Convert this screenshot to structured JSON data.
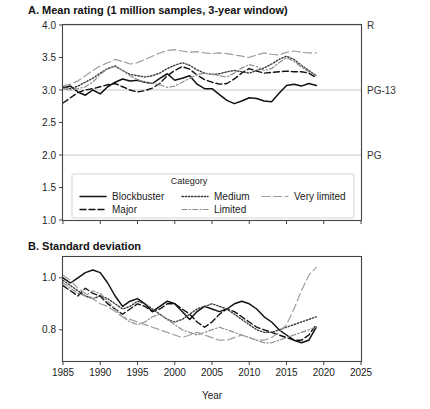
{
  "figure": {
    "axis_title": "Year",
    "legend_title": "Category"
  },
  "chart_data": [
    {
      "id": "panel_a",
      "type": "line",
      "title": "A. Mean rating (1 million samples, 3-year window)",
      "xlabel": "",
      "ylabel": "",
      "xlim": [
        1985,
        2025
      ],
      "ylim": [
        1.0,
        4.0
      ],
      "xticks": [
        1985,
        1990,
        1995,
        2000,
        2005,
        2010,
        2015,
        2020,
        2025
      ],
      "xticklabels": [
        "",
        "",
        "",
        "",
        "",
        "",
        "",
        "",
        ""
      ],
      "yticks": [
        1.0,
        1.5,
        2.0,
        2.5,
        3.0,
        3.5,
        4.0
      ],
      "yticklabels": [
        "1.0",
        "1.5",
        "2.0",
        "2.5",
        "3.0",
        "3.5",
        "4.0"
      ],
      "grid": true,
      "gridlines_y": [
        2.0,
        3.0,
        4.0
      ],
      "reference_labels": [
        {
          "text": "R",
          "value": 4.0
        },
        {
          "text": "PG-13",
          "value": 3.0
        },
        {
          "text": "PG",
          "value": 2.0
        }
      ],
      "legend_position": "inside-bottom",
      "x": [
        1985,
        1986,
        1987,
        1988,
        1989,
        1990,
        1991,
        1992,
        1993,
        1994,
        1995,
        1996,
        1997,
        1998,
        1999,
        2000,
        2001,
        2002,
        2003,
        2004,
        2005,
        2006,
        2007,
        2008,
        2009,
        2010,
        2011,
        2012,
        2013,
        2014,
        2015,
        2016,
        2017,
        2018,
        2019
      ],
      "series": [
        {
          "name": "Blockbuster",
          "style": "solid",
          "color": "#111111",
          "values": [
            3.03,
            3.06,
            2.97,
            2.92,
            3.0,
            2.94,
            3.05,
            3.12,
            3.17,
            3.14,
            3.15,
            3.12,
            3.1,
            3.18,
            3.25,
            3.15,
            3.18,
            3.22,
            3.09,
            3.02,
            3.02,
            2.93,
            2.84,
            2.79,
            2.83,
            2.88,
            2.87,
            2.83,
            2.82,
            2.95,
            3.07,
            3.09,
            3.06,
            3.1,
            3.07
          ]
        },
        {
          "name": "Major",
          "style": "dashed",
          "color": "#111111",
          "values": [
            2.8,
            2.88,
            2.96,
            3.0,
            3.02,
            3.05,
            3.08,
            3.1,
            3.05,
            3.0,
            2.97,
            2.99,
            3.03,
            3.1,
            3.22,
            3.3,
            3.36,
            3.32,
            3.23,
            3.16,
            3.12,
            3.09,
            3.1,
            3.17,
            3.26,
            3.33,
            3.29,
            3.26,
            3.27,
            3.28,
            3.29,
            3.28,
            3.28,
            3.26,
            3.19
          ]
        },
        {
          "name": "Medium",
          "style": "dotted",
          "color": "#3a3a3a",
          "values": [
            3.05,
            3.02,
            3.06,
            3.12,
            3.18,
            3.26,
            3.33,
            3.37,
            3.3,
            3.24,
            3.22,
            3.2,
            3.22,
            3.26,
            3.33,
            3.38,
            3.42,
            3.38,
            3.31,
            3.26,
            3.24,
            3.25,
            3.28,
            3.3,
            3.28,
            3.26,
            3.3,
            3.34,
            3.4,
            3.47,
            3.52,
            3.47,
            3.38,
            3.3,
            3.22
          ]
        },
        {
          "name": "Limited",
          "style": "dashdot",
          "color": "#8d8d8d",
          "values": [
            3.02,
            3.0,
            3.02,
            3.05,
            3.12,
            3.24,
            3.33,
            3.36,
            3.3,
            3.22,
            3.16,
            3.12,
            3.1,
            3.08,
            3.04,
            3.06,
            3.12,
            3.18,
            3.24,
            3.26,
            3.24,
            3.22,
            3.2,
            3.26,
            3.34,
            3.39,
            3.36,
            3.3,
            3.33,
            3.42,
            3.5,
            3.44,
            3.35,
            3.28,
            3.22
          ]
        },
        {
          "name": "Very limited",
          "style": "longdash",
          "color": "#9e9e9e",
          "values": [
            3.06,
            3.09,
            3.14,
            3.22,
            3.3,
            3.37,
            3.42,
            3.47,
            3.44,
            3.4,
            3.42,
            3.47,
            3.52,
            3.57,
            3.61,
            3.62,
            3.6,
            3.58,
            3.59,
            3.57,
            3.56,
            3.57,
            3.56,
            3.54,
            3.52,
            3.5,
            3.54,
            3.57,
            3.55,
            3.54,
            3.58,
            3.6,
            3.58,
            3.57,
            3.57
          ]
        }
      ]
    },
    {
      "id": "panel_b",
      "type": "line",
      "title": "B. Standard deviation",
      "xlabel": "Year",
      "ylabel": "",
      "xlim": [
        1985,
        2025
      ],
      "ylim": [
        0.68,
        1.08
      ],
      "xticks": [
        1985,
        1990,
        1995,
        2000,
        2005,
        2010,
        2015,
        2020,
        2025
      ],
      "xticklabels": [
        "1985",
        "1990",
        "1995",
        "2000",
        "2005",
        "2010",
        "2015",
        "2020",
        "2025"
      ],
      "yticks": [
        0.8,
        1.0
      ],
      "yticklabels": [
        "0.8",
        "1.0"
      ],
      "grid": false,
      "legend_position": "none",
      "x": [
        1985,
        1986,
        1987,
        1988,
        1989,
        1990,
        1991,
        1992,
        1993,
        1994,
        1995,
        1996,
        1997,
        1998,
        1999,
        2000,
        2001,
        2002,
        2003,
        2004,
        2005,
        2006,
        2007,
        2008,
        2009,
        2010,
        2011,
        2012,
        2013,
        2014,
        2015,
        2016,
        2017,
        2018,
        2019
      ],
      "series": [
        {
          "name": "Blockbuster",
          "style": "solid",
          "color": "#111111",
          "values": [
            1.0,
            0.98,
            1.0,
            1.02,
            1.03,
            1.02,
            0.98,
            0.93,
            0.89,
            0.91,
            0.92,
            0.9,
            0.87,
            0.89,
            0.91,
            0.9,
            0.87,
            0.84,
            0.87,
            0.89,
            0.88,
            0.87,
            0.88,
            0.9,
            0.91,
            0.9,
            0.88,
            0.85,
            0.83,
            0.8,
            0.78,
            0.76,
            0.75,
            0.76,
            0.81
          ]
        },
        {
          "name": "Major",
          "style": "dashed",
          "color": "#111111",
          "values": [
            0.97,
            0.95,
            0.93,
            0.96,
            0.94,
            0.93,
            0.9,
            0.88,
            0.86,
            0.88,
            0.9,
            0.89,
            0.87,
            0.88,
            0.9,
            0.9,
            0.88,
            0.86,
            0.83,
            0.81,
            0.83,
            0.86,
            0.88,
            0.87,
            0.85,
            0.83,
            0.81,
            0.8,
            0.79,
            0.78,
            0.77,
            0.76,
            0.76,
            0.78,
            0.82
          ]
        },
        {
          "name": "Medium",
          "style": "dotted",
          "color": "#3a3a3a",
          "values": [
            0.99,
            0.97,
            0.95,
            0.93,
            0.92,
            0.93,
            0.92,
            0.9,
            0.88,
            0.89,
            0.91,
            0.9,
            0.88,
            0.86,
            0.84,
            0.83,
            0.84,
            0.86,
            0.88,
            0.89,
            0.9,
            0.89,
            0.88,
            0.86,
            0.84,
            0.82,
            0.8,
            0.79,
            0.79,
            0.8,
            0.81,
            0.82,
            0.83,
            0.84,
            0.85
          ]
        },
        {
          "name": "Limited",
          "style": "dashdot",
          "color": "#8d8d8d",
          "values": [
            0.98,
            0.96,
            0.94,
            0.93,
            0.95,
            0.94,
            0.91,
            0.88,
            0.85,
            0.83,
            0.82,
            0.83,
            0.85,
            0.86,
            0.84,
            0.82,
            0.8,
            0.79,
            0.78,
            0.79,
            0.8,
            0.81,
            0.8,
            0.79,
            0.78,
            0.77,
            0.76,
            0.75,
            0.75,
            0.76,
            0.77,
            0.78,
            0.79,
            0.8,
            0.81
          ]
        },
        {
          "name": "Very limited",
          "style": "longdash",
          "color": "#9e9e9e",
          "values": [
            1.01,
            0.99,
            0.96,
            0.94,
            0.92,
            0.9,
            0.89,
            0.87,
            0.85,
            0.84,
            0.83,
            0.82,
            0.81,
            0.8,
            0.79,
            0.78,
            0.77,
            0.78,
            0.79,
            0.78,
            0.77,
            0.76,
            0.76,
            0.77,
            0.78,
            0.77,
            0.76,
            0.76,
            0.77,
            0.79,
            0.82,
            0.88,
            0.95,
            1.01,
            1.04
          ]
        }
      ]
    }
  ],
  "legend": {
    "title": "Category",
    "entries": [
      {
        "label": "Blockbuster",
        "style": "solid"
      },
      {
        "label": "Major",
        "style": "dashed"
      },
      {
        "label": "Medium",
        "style": "dotted"
      },
      {
        "label": "Limited",
        "style": "dashdot"
      },
      {
        "label": "Very limited",
        "style": "longdash"
      }
    ]
  }
}
